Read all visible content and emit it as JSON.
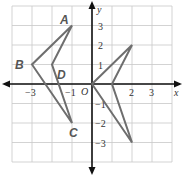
{
  "diagram": {
    "type": "coordinate-grid",
    "grid": {
      "xmin": -4,
      "xmax": 4,
      "ymin": -4,
      "ymax": 4,
      "color": "#c8c8c8"
    },
    "axes": {
      "x_label": "x",
      "y_label": "y",
      "origin_label": "O",
      "color": "#111111"
    },
    "x_ticks": [
      {
        "value": -3,
        "label": "−3"
      },
      {
        "value": -1,
        "label": "−1"
      },
      {
        "value": 2,
        "label": "2"
      },
      {
        "value": 3,
        "label": "3"
      }
    ],
    "y_ticks": [
      {
        "value": 3,
        "label": "3"
      },
      {
        "value": 2,
        "label": "2"
      },
      {
        "value": 1,
        "label": "1"
      },
      {
        "value": -1,
        "label": "−1"
      },
      {
        "value": -2,
        "label": "−2"
      },
      {
        "value": -3,
        "label": "−3"
      }
    ],
    "shapes": [
      {
        "name": "figure-ABCD",
        "color": "#6e6e6e",
        "points": [
          [
            -1,
            3
          ],
          [
            -3,
            1
          ],
          [
            -1,
            -2
          ],
          [
            -2,
            1
          ]
        ]
      },
      {
        "name": "figure-image",
        "color": "#6e6e6e",
        "points": [
          [
            0,
            0
          ],
          [
            2,
            2
          ],
          [
            1,
            0
          ],
          [
            2,
            -3
          ]
        ]
      }
    ],
    "point_labels": [
      {
        "label": "A",
        "x": -1,
        "y": 3
      },
      {
        "label": "B",
        "x": -3,
        "y": 1
      },
      {
        "label": "C",
        "x": -1,
        "y": -2
      },
      {
        "label": "D",
        "x": -2,
        "y": 1
      }
    ]
  }
}
